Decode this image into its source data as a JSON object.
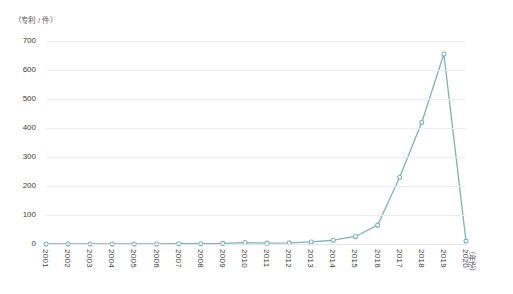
{
  "chart_data": {
    "type": "line",
    "title": "",
    "subtitle": "",
    "xlabel": "（年份）",
    "ylabel": "（专利 / 件）",
    "categories": [
      "2001",
      "2002",
      "2003",
      "2004",
      "2005",
      "2006",
      "2007",
      "2008",
      "2009",
      "2010",
      "2011",
      "2012",
      "2013",
      "2014",
      "2015",
      "2016",
      "2017",
      "2018",
      "2019",
      "2020"
    ],
    "series": [
      {
        "name": "专利数量",
        "color": "#7fb2bd",
        "marker": "open-circle",
        "values": [
          0,
          0,
          0,
          0,
          0,
          0,
          1,
          1,
          2,
          5,
          3,
          4,
          7,
          13,
          26,
          65,
          230,
          420,
          655,
          10
        ]
      }
    ],
    "ylim": [
      0,
      700
    ],
    "yticks": [
      0,
      100,
      200,
      300,
      400,
      500,
      600,
      700
    ],
    "ytick_labels": [
      "0",
      "100",
      "200",
      "300",
      "400",
      "500",
      "600",
      "700"
    ],
    "grid": "horizontal",
    "grid_color": "#ededed",
    "legend": "none",
    "axis_line_color": "#e4e4e4",
    "background": "#ffffff",
    "annotations": []
  },
  "axes": {
    "y_unit_caption": "（专利 / 件）",
    "x_unit_caption": "（年份）"
  }
}
